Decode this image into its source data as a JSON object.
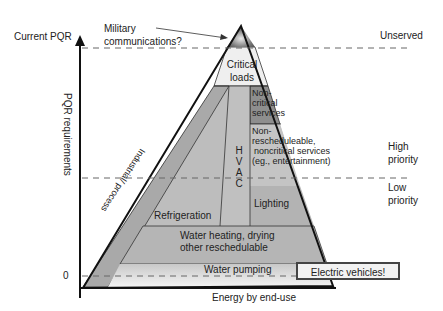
{
  "diagram": {
    "type": "pyramid",
    "y_axis": {
      "label": "PQR requirements",
      "top_label": "Current PQR",
      "zero_label": "0"
    },
    "x_axis": {
      "label": "Energy by end-use"
    },
    "annotations": {
      "military": "Military communications?",
      "unserved": "Unserved",
      "high_priority": "High priority",
      "low_priority": "Low priority"
    },
    "segments": {
      "critical": "Critical loads",
      "noncritical": "Non-critical services",
      "nonresched_line1": "Non-",
      "nonresched_line2": "rescheduleable,",
      "nonresched_line3": "noncritical services",
      "nonresched_line4": "(eg., entertainment)",
      "industrial": "Industrial/ process",
      "hvac": [
        "H",
        "V",
        "A",
        "C"
      ],
      "refrigeration": "Refrigeration",
      "lighting": "Lighting",
      "water_heating_line1": "Water heating, drying",
      "water_heating_line2": "other reschedulable",
      "water_pumping": "Water pumping",
      "electric_vehicles": "Electric vehicles!"
    },
    "colors": {
      "critical": "#efefef",
      "noncritical": "#8a8a8a",
      "body": "#b8b8b8",
      "industrial": "#a8a8a8",
      "water_pumping": "#cfcfcf"
    }
  }
}
